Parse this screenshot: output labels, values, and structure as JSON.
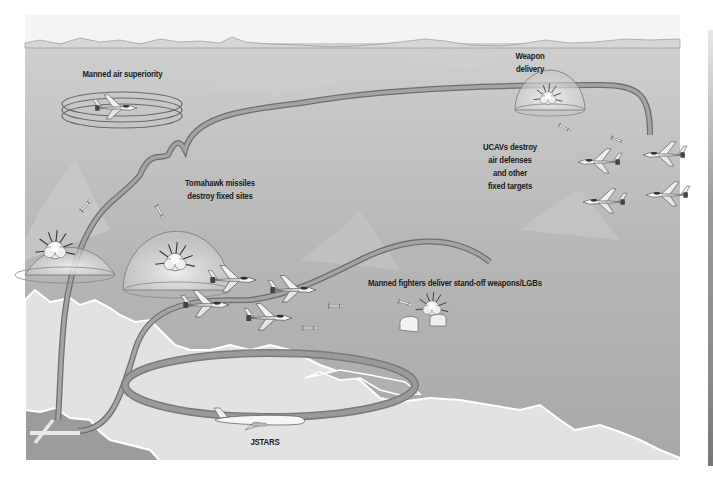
{
  "diagram": {
    "type": "air-operations illustration",
    "labels": {
      "manned_air_superiority": "Manned air superiority",
      "weapon_delivery": [
        "Weapon",
        "delivery"
      ],
      "tomahawk": [
        "Tomahawk missiles",
        "destroy fixed sites"
      ],
      "ucavs": [
        "UCAVs destroy",
        "air defenses",
        "and other",
        "fixed targets"
      ],
      "manned_fighters": "Manned fighters deliver stand-off weapons/LGBs",
      "jstars": "JSTARS"
    },
    "elements": [
      {
        "name": "air-superiority-orbit",
        "kind": "ring with fighter jet"
      },
      {
        "name": "weapon-delivery-dome",
        "kind": "dome with explosion"
      },
      {
        "name": "tomahawk-target-dome-1",
        "kind": "dome with explosion and missile"
      },
      {
        "name": "tomahawk-target-dome-2",
        "kind": "dome with explosion and missile"
      },
      {
        "name": "ucav-formation",
        "kind": "4 unmanned combat aircraft",
        "count": 4
      },
      {
        "name": "manned-fighter-formation",
        "kind": "4 fighter jets",
        "count": 4
      },
      {
        "name": "bunker-target",
        "kind": "hardened shelters with explosion"
      },
      {
        "name": "jstars-orbit",
        "kind": "oval track with JSTARS aircraft"
      },
      {
        "name": "airbase-runway",
        "kind": "crossed runways"
      }
    ],
    "colors": {
      "sky": "#b4b4b4",
      "land_light": "#e2e2e2",
      "land_dark": "#9c9c9c",
      "ribbon": "#8a8a8a",
      "text": "#1c1c1c"
    }
  }
}
